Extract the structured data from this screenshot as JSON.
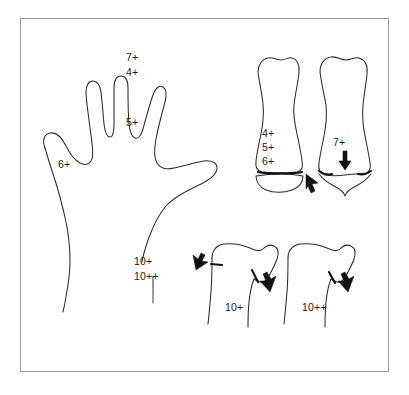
{
  "figure": {
    "frame": {
      "border_color": "#9a9a9a",
      "background": "#ffffff"
    },
    "ink_color": "#2b2b2b",
    "label_color": "#1a1a1a"
  },
  "hand_diagram": {
    "name": "hand-outline",
    "description": "Outline of a left hand, palm view, with maturation stage labels at the digits and wrist",
    "labels": [
      {
        "id": "hand-label-7plus",
        "text": "7+",
        "x": 126,
        "y": 52,
        "target": "middle-finger-tip"
      },
      {
        "id": "hand-label-4plus",
        "text": "4+",
        "x": 126,
        "y": 67,
        "target": "middle-finger-distal-phalanx"
      },
      {
        "id": "hand-label-5plus",
        "text": "5+",
        "x": 126,
        "y": 117,
        "target": "middle-finger-middle-phalanx"
      },
      {
        "id": "hand-label-6plus",
        "text": "6+",
        "x": 58,
        "y": 159,
        "target": "thumb"
      },
      {
        "id": "hand-label-10plus",
        "text": "10+",
        "x": 134,
        "y": 256,
        "target": "wrist-radius"
      },
      {
        "id": "hand-label-10plusplus",
        "text": "10++",
        "x": 134,
        "y": 271,
        "target": "wrist-ulna"
      }
    ]
  },
  "phalanx_diagrams": {
    "name": "phalanx-detail-pair",
    "description": "Two enlarged phalanx bone outlines showing the epiphyseal growth plate before and after fusion",
    "items": [
      {
        "id": "phalanx-unfused",
        "caption_lines": [
          "4+",
          "5+",
          "6+"
        ],
        "caption_x": 262,
        "caption_y_start": 128,
        "caption_line_height": 14,
        "annotation": "open epiphyseal plate",
        "arrow": "cursor-arrow-right-of-plate"
      },
      {
        "id": "phalanx-fusing",
        "caption_lines": [
          "7+"
        ],
        "caption_x": 333,
        "caption_y_start": 137,
        "caption_line_height": 14,
        "annotation": "capping / fusing epiphysis",
        "arrow": "down-arrow-over-plate"
      }
    ]
  },
  "distal_radius_diagrams": {
    "name": "distal-radius-detail-pair",
    "description": "Two enlarged distal radius outlines showing progressive growth plate fusion",
    "items": [
      {
        "id": "radius-10plus",
        "caption": "10+",
        "caption_x": 225,
        "caption_y": 302,
        "annotations": [
          "lateral plate mark",
          "medial plate mark"
        ],
        "arrows": [
          "cursor-arrow-left",
          "cursor-arrow-center"
        ]
      },
      {
        "id": "radius-10plusplus",
        "caption": "10++",
        "caption_x": 302,
        "caption_y": 302,
        "annotations": [
          "medial plate mark"
        ],
        "arrows": [
          "cursor-arrow-right"
        ]
      }
    ]
  },
  "all_stage_codes": [
    "4+",
    "5+",
    "6+",
    "7+",
    "10+",
    "10++"
  ]
}
